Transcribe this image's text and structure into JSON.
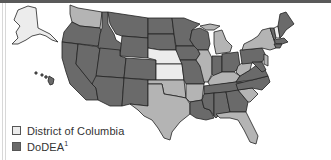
{
  "map": {
    "type": "choropleth",
    "region": "United States",
    "colors": {
      "lightest": "#ececec",
      "light": "#b4b4b4",
      "dark": "#6a6a6a",
      "border": "#222222"
    }
  },
  "legend": {
    "items": [
      {
        "label": "District of Columbia",
        "swatch_color": "#ececec"
      },
      {
        "label": "DoDEA",
        "superscript": "1",
        "swatch_color": "#6a6a6a"
      }
    ]
  },
  "states": {
    "lightest": [
      "AK",
      "NE",
      "KS",
      "NH"
    ],
    "light": [
      "WA",
      "IL",
      "MI",
      "OK",
      "TX",
      "AR",
      "KY",
      "SC",
      "FL",
      "WV",
      "NY"
    ],
    "dark": [
      "OR",
      "CA",
      "NV",
      "ID",
      "MT",
      "WY",
      "UT",
      "AZ",
      "CO",
      "NM",
      "ND",
      "SD",
      "MN",
      "IA",
      "MO",
      "WI",
      "IN",
      "OH",
      "TN",
      "LA",
      "MS",
      "AL",
      "GA",
      "NC",
      "VA",
      "PA",
      "ME",
      "VT",
      "MA",
      "HI"
    ]
  }
}
